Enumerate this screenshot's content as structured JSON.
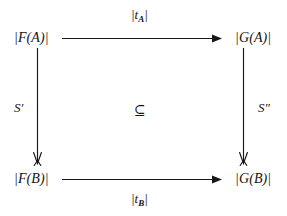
{
  "figure": {
    "kind": "commutative-diagram",
    "background_color": "#ffffff",
    "ink_color": "#171717"
  },
  "nodes": {
    "top_left": "|F(A)|",
    "top_right": "|G(A)|",
    "bottom_left": "|F(B)|",
    "bottom_right": "|G(B)|"
  },
  "edges": {
    "top": {
      "label_prefix": "|t",
      "label_sub": "A",
      "label_suffix": "|",
      "direction": "left-to-right",
      "head": "filled-triangle"
    },
    "bottom": {
      "label_prefix": "|t",
      "label_sub": "B",
      "label_suffix": "|",
      "direction": "left-to-right",
      "head": "filled-triangle"
    },
    "left": {
      "label": "S′",
      "direction": "top-to-bottom",
      "head": "barbed-harpoon"
    },
    "right": {
      "label": "S″",
      "direction": "top-to-bottom",
      "head": "barbed-harpoon"
    }
  },
  "center": {
    "symbol": "⊆",
    "symbol_name": "subset-or-equal"
  }
}
